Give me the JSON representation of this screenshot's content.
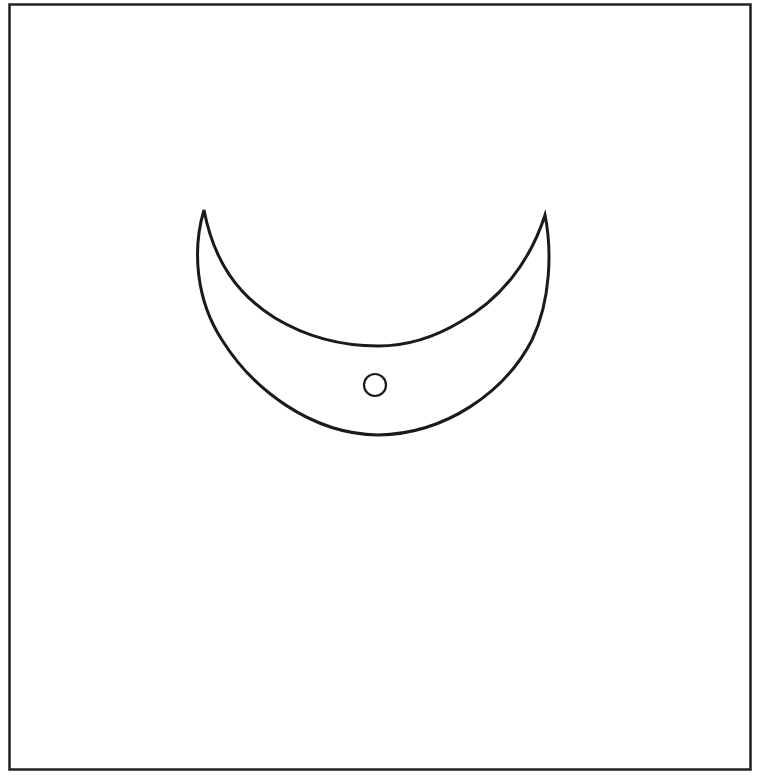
{
  "figure": {
    "colors": {
      "background": "#ffffff",
      "stroke": "#1a1a1a",
      "frame": "#222222"
    },
    "frame": {
      "x": 9,
      "y": 4,
      "width": 741,
      "height": 765
    },
    "crescent": {
      "left_tip": [
        204,
        210
      ],
      "right_tip": [
        545,
        215
      ],
      "outer_bottom": [
        378,
        435
      ],
      "inner_bottom": [
        378,
        346
      ]
    },
    "dot": {
      "cx": 375,
      "cy": 385,
      "r": 11
    }
  }
}
